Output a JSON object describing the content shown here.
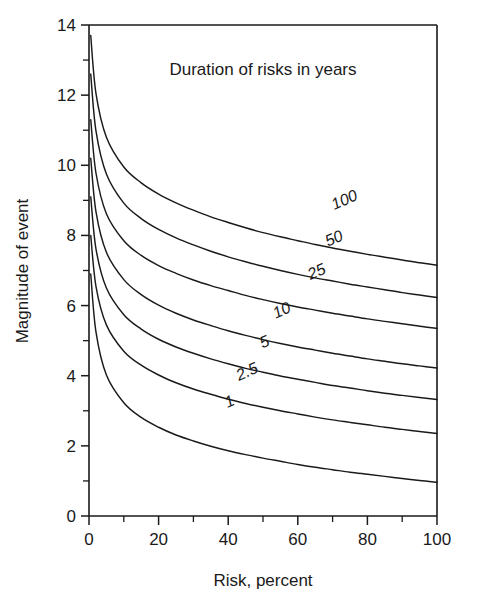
{
  "chart_data": {
    "type": "line",
    "title": "Duration of risks in years",
    "xlabel": "Risk, percent",
    "ylabel": "Magnitude of event",
    "xlim": [
      0,
      100
    ],
    "ylim": [
      0,
      14
    ],
    "xticks": [
      0,
      20,
      40,
      60,
      80,
      100
    ],
    "xticks_labels": [
      "0",
      "20",
      "40",
      "60",
      "80",
      "100"
    ],
    "xticks_minor": [
      10,
      30,
      50,
      70,
      90
    ],
    "yticks": [
      0,
      2,
      4,
      6,
      8,
      10,
      12,
      14
    ],
    "yticks_labels": [
      "0",
      "2",
      "4",
      "6",
      "8",
      "10",
      "12",
      "14"
    ],
    "yticks_minor": [
      1,
      3,
      5,
      7,
      9,
      11,
      13
    ],
    "grid": false,
    "legend": "inline-curve-labels",
    "x": [
      0.5,
      2,
      5,
      10,
      15,
      20,
      25,
      30,
      35,
      40,
      45,
      50,
      55,
      60,
      65,
      70,
      75,
      80,
      85,
      90,
      95,
      100
    ],
    "series": [
      {
        "name": "100",
        "label": "100",
        "label_x": 74,
        "label_y": 9.05,
        "values": [
          13.7,
          12.05,
          10.8,
          9.95,
          9.5,
          9.18,
          8.93,
          8.72,
          8.53,
          8.37,
          8.22,
          8.08,
          7.96,
          7.85,
          7.74,
          7.64,
          7.55,
          7.46,
          7.38,
          7.3,
          7.22,
          7.15
        ]
      },
      {
        "name": "50",
        "label": "50",
        "label_x": 71,
        "label_y": 7.95,
        "values": [
          12.6,
          10.98,
          9.75,
          8.92,
          8.48,
          8.17,
          7.93,
          7.73,
          7.55,
          7.39,
          7.25,
          7.12,
          7.0,
          6.89,
          6.79,
          6.7,
          6.61,
          6.53,
          6.45,
          6.37,
          6.3,
          6.23
        ]
      },
      {
        "name": "25",
        "label": "25",
        "label_x": 66,
        "label_y": 7.0,
        "values": [
          11.3,
          9.78,
          8.62,
          7.85,
          7.43,
          7.14,
          6.92,
          6.73,
          6.57,
          6.43,
          6.29,
          6.17,
          6.06,
          5.96,
          5.87,
          5.78,
          5.7,
          5.62,
          5.55,
          5.48,
          5.41,
          5.35
        ]
      },
      {
        "name": "10",
        "label": "10",
        "label_x": 56,
        "label_y": 5.9,
        "values": [
          10.2,
          8.68,
          7.52,
          6.74,
          6.31,
          6.01,
          5.78,
          5.59,
          5.43,
          5.28,
          5.15,
          5.03,
          4.92,
          4.82,
          4.73,
          4.64,
          4.56,
          4.48,
          4.41,
          4.34,
          4.28,
          4.22
        ]
      },
      {
        "name": "5",
        "label": "5",
        "label_x": 51,
        "label_y": 5.0,
        "values": [
          9.1,
          7.62,
          6.5,
          5.74,
          5.33,
          5.04,
          4.82,
          4.64,
          4.48,
          4.34,
          4.21,
          4.1,
          3.99,
          3.9,
          3.81,
          3.72,
          3.65,
          3.57,
          3.5,
          3.44,
          3.38,
          3.32
        ]
      },
      {
        "name": "2.5",
        "label": "2.5",
        "label_x": 46,
        "label_y": 4.15,
        "values": [
          8.0,
          6.55,
          5.45,
          4.7,
          4.3,
          4.02,
          3.8,
          3.62,
          3.47,
          3.33,
          3.21,
          3.1,
          3.0,
          2.91,
          2.82,
          2.74,
          2.67,
          2.6,
          2.53,
          2.47,
          2.41,
          2.35
        ]
      },
      {
        "name": "1",
        "label": "1",
        "label_x": 41,
        "label_y": 3.3,
        "values": [
          6.9,
          5.25,
          4.02,
          3.23,
          2.81,
          2.53,
          2.31,
          2.14,
          1.99,
          1.86,
          1.75,
          1.65,
          1.56,
          1.47,
          1.39,
          1.32,
          1.25,
          1.19,
          1.13,
          1.07,
          1.01,
          0.96
        ]
      }
    ]
  }
}
